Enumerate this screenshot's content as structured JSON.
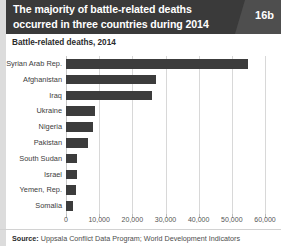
{
  "header": {
    "title": "The majority of battle-related deaths occurred in three countries during 2014",
    "badge": "16b"
  },
  "subtitle": "Battle-related deaths, 2014",
  "footer": {
    "source_label": "Source:",
    "source_text": "Uppsala Conflict Data Program; World Development Indicators"
  },
  "colors": {
    "header_bg": "#3a3a3a",
    "badge_bg": "#4e4e4e",
    "bar": "#3c3c3c",
    "grid": "#d8d8d8"
  },
  "chart_data": {
    "type": "bar",
    "orientation": "horizontal",
    "title": "The majority of battle-related deaths occurred in three countries during 2014",
    "subtitle": "Battle-related deaths, 2014",
    "xlabel": "",
    "ylabel": "",
    "xlim": [
      0,
      60000
    ],
    "xticks": [
      0,
      10000,
      20000,
      30000,
      40000,
      50000,
      60000
    ],
    "xtick_labels": [
      "0",
      "10,000",
      "20,000",
      "30,000",
      "40,000",
      "50,000",
      "60,000"
    ],
    "grid": true,
    "legend": false,
    "categories": [
      "Syrian Arab Rep.",
      "Afghanistan",
      "Iraq",
      "Ukraine",
      "Nigeria",
      "Pakistan",
      "South Sudan",
      "Israel",
      "Yemen, Rep.",
      "Somalia"
    ],
    "values": [
      55000,
      27000,
      26000,
      8700,
      8200,
      6500,
      3400,
      3300,
      3100,
      2200
    ]
  }
}
